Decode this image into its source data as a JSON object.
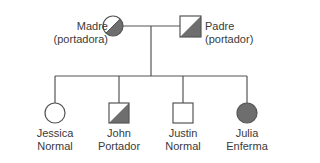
{
  "diagram": {
    "type": "pedigree",
    "colors": {
      "line": "#555555",
      "affected_fill": "#6e6e6e",
      "unaffected_fill": "#ffffff"
    },
    "parents": [
      {
        "id": "mother",
        "name": "Madre",
        "status": "(portadora)",
        "sex": "female",
        "phenotype": "carrier"
      },
      {
        "id": "father",
        "name": "Padre",
        "status": "(portador)",
        "sex": "male",
        "phenotype": "carrier"
      }
    ],
    "children": [
      {
        "id": "jessica",
        "name": "Jessica",
        "status": "Normal",
        "sex": "female",
        "phenotype": "normal"
      },
      {
        "id": "john",
        "name": "John",
        "status": "Portador",
        "sex": "male",
        "phenotype": "carrier"
      },
      {
        "id": "justin",
        "name": "Justin",
        "status": "Normal",
        "sex": "male",
        "phenotype": "normal"
      },
      {
        "id": "julia",
        "name": "Julia",
        "status": "Enferma",
        "sex": "female",
        "phenotype": "affected"
      }
    ]
  }
}
